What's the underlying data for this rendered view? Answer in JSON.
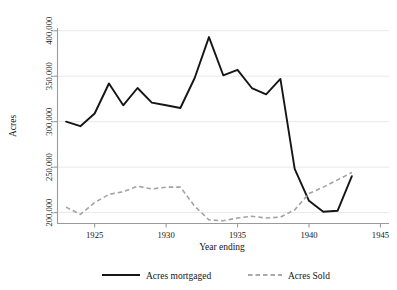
{
  "chart_data": {
    "type": "line",
    "title": "",
    "xlabel": "Year ending",
    "ylabel": "Acres",
    "xlim": [
      1922.4,
      1945.6
    ],
    "ylim": [
      188000,
      403000
    ],
    "grid": true,
    "legend_position": "bottom",
    "xticks": [
      1925,
      1930,
      1935,
      1940,
      1945
    ],
    "xticklabels": [
      "1925",
      "1930",
      "1935",
      "1940",
      "1945"
    ],
    "yticks": [
      200000,
      250000,
      300000,
      350000,
      400000
    ],
    "yticklabels": [
      "200,000",
      "250,000",
      "300,000",
      "350,000",
      "400,000"
    ],
    "x": [
      1923,
      1924,
      1925,
      1926,
      1927,
      1928,
      1929,
      1930,
      1931,
      1932,
      1933,
      1934,
      1935,
      1936,
      1937,
      1938,
      1939,
      1940,
      1941,
      1942,
      1943
    ],
    "series": [
      {
        "name": "Acres mortgaged",
        "style": "solid",
        "color": "#151515",
        "values": [
          300000,
          295000,
          309000,
          342000,
          318000,
          337000,
          321000,
          318000,
          315000,
          348000,
          393000,
          351000,
          357000,
          337000,
          330000,
          347000,
          248000,
          213000,
          201000,
          202000,
          240000
        ]
      },
      {
        "name": "Acres Sold",
        "style": "dashed",
        "color": "#a3a3a3",
        "values": [
          206000,
          198000,
          211000,
          220000,
          223000,
          229000,
          226000,
          228000,
          228000,
          207000,
          192000,
          191000,
          194000,
          196000,
          194000,
          195000,
          203000,
          221000,
          228000,
          236000,
          244000
        ]
      }
    ],
    "series_2_note": null
  },
  "legend": {
    "entries": [
      {
        "label": "Acres mortgaged",
        "style": "solid"
      },
      {
        "label": "Acres Sold",
        "style": "dashed"
      }
    ]
  }
}
